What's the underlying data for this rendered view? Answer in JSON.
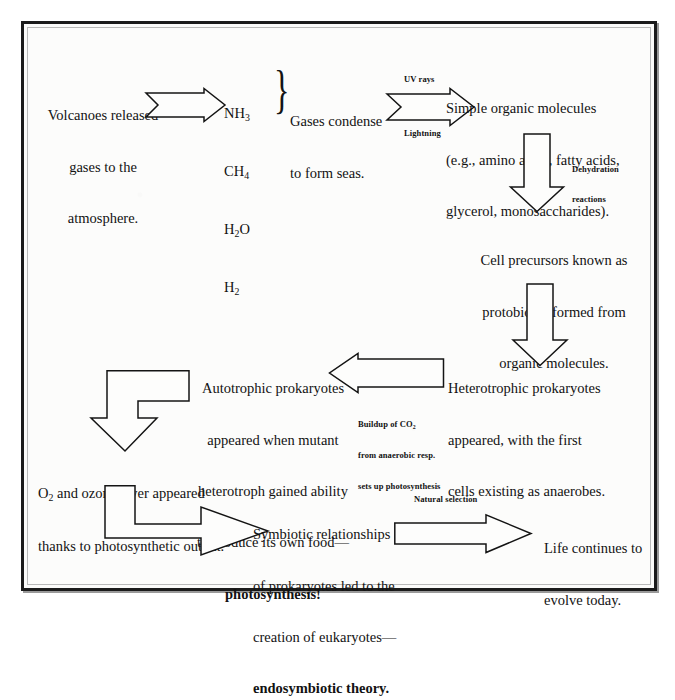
{
  "diagram": {
    "background_color": "#fcfcfb",
    "ink_color": "#121212",
    "frame_color": "#1b1b1b"
  },
  "nodes": {
    "volcanoes": {
      "line1": "Volcanoes released",
      "line2": "gases to the",
      "line3": "atmosphere."
    },
    "gases": {
      "g1": "NH",
      "g1sub": "3",
      "g2": "CH",
      "g2sub": "4",
      "g3a": "H",
      "g3sub": "2",
      "g3b": "O",
      "g4": "H",
      "g4sub": "2"
    },
    "condense": {
      "line1": "Gases condense",
      "line2": "to form seas."
    },
    "simple_organic": {
      "line1": "Simple organic molecules",
      "line2": "(e.g., amino acids, fatty acids,",
      "line3": "glycerol, monosaccharides)."
    },
    "cell_precursors": {
      "line1": "Cell precursors known as",
      "line2": "protobionts formed from",
      "line3": "organic molecules."
    },
    "heterotrophic": {
      "line1": "Heterotrophic prokaryotes",
      "line2": "appeared, with the first",
      "line3": "cells existing as anaerobes."
    },
    "autotrophic": {
      "line1": "Autotrophic prokaryotes",
      "line2": "appeared when mutant",
      "line3": "heterotroph gained ability",
      "line4": "to produce its own food—",
      "line5": "photosynthesis!"
    },
    "ozone": {
      "line1a": "O",
      "line1sub": "2",
      "line1b": " and ozone layer appeared",
      "line2": "thanks to photosynthetic output."
    },
    "symbiotic": {
      "line1": "Symbiotic relationships",
      "line2": "of prokaryotes led to the",
      "line3": "creation of eukaryotes—",
      "line4": "endosymbiotic theory."
    },
    "life_evolves": {
      "line1": "Life continues to",
      "line2": "evolve today."
    }
  },
  "arrow_labels": {
    "uv_rays": "UV rays",
    "lightning": "Lightning",
    "dehydration_line1": "Dehydration",
    "dehydration_line2": "reactions",
    "buildup_line1a": "Buildup of CO",
    "buildup_line1sub": "2",
    "buildup_line2": "from anaerobic resp.",
    "buildup_line3": "sets up photosynthesis",
    "natural_selection": "Natural selection"
  },
  "arrows": [
    {
      "name": "arrow-volcanoes-to-gases",
      "direction": "right"
    },
    {
      "name": "arrow-seas-to-organic",
      "direction": "right"
    },
    {
      "name": "arrow-organic-to-protobionts",
      "direction": "down"
    },
    {
      "name": "arrow-protobionts-to-heterotroph",
      "direction": "down"
    },
    {
      "name": "arrow-heterotroph-to-autotroph",
      "direction": "left"
    },
    {
      "name": "arrow-autotroph-to-ozone",
      "direction": "elbow-down"
    },
    {
      "name": "arrow-ozone-to-symbiotic",
      "direction": "elbow-right"
    },
    {
      "name": "arrow-symbiotic-to-life",
      "direction": "right"
    }
  ]
}
